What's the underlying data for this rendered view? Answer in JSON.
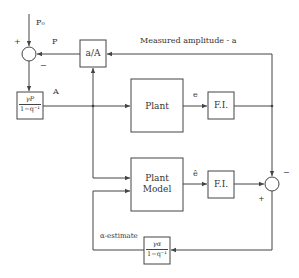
{
  "diagram": {
    "type": "block-diagram",
    "blocks": {
      "ratio": {
        "label": "a/A"
      },
      "gain_p": {
        "numerator": "γP",
        "denominator": "1−q⁻¹"
      },
      "plant": {
        "label": "Plant"
      },
      "fi_top": {
        "label": "F.I."
      },
      "plant_model": {
        "label_line1": "Plant",
        "label_line2": "Model"
      },
      "fi_bottom": {
        "label": "F.I."
      },
      "gain_alpha": {
        "numerator": "γα",
        "denominator": "1−q⁻¹"
      }
    },
    "signals": {
      "p0": "P₀",
      "p": "P",
      "a_big": "A",
      "measured": "Measured amplitude - a",
      "e": "e",
      "e_hat": "ê",
      "alpha_est": "α-estimate"
    },
    "signs": {
      "left_plus": "+",
      "left_minus": "−",
      "right_minus": "−",
      "right_plus": "+"
    },
    "colors": {
      "line": "#444444",
      "background": "#ffffff"
    }
  }
}
